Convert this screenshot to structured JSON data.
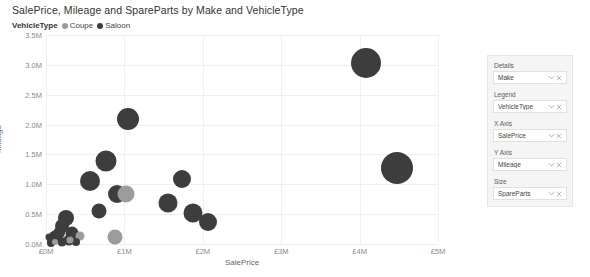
{
  "visual": {
    "title": "SalePrice, Mileage and SpareParts by Make and VehicleType"
  },
  "legend": {
    "title": "VehicleType",
    "items": [
      {
        "label": "Coupe",
        "color": "#9b9b9b"
      },
      {
        "label": "Saloon",
        "color": "#3d3d3d"
      }
    ]
  },
  "fields": {
    "wells": [
      {
        "label": "Details",
        "field": "Make"
      },
      {
        "label": "Legend",
        "field": "VehicleType"
      },
      {
        "label": "X Axis",
        "field": "SalePrice"
      },
      {
        "label": "Y Axis",
        "field": "Mileage"
      },
      {
        "label": "Size",
        "field": "SpareParts"
      }
    ],
    "icons": {
      "expand": "chevron-down-icon",
      "remove": "close-icon"
    }
  },
  "chart_data": {
    "type": "scatter",
    "title": "SalePrice, Mileage and SpareParts by Make and VehicleType",
    "xlabel": "SalePrice",
    "ylabel": "Mileage",
    "xlim": [
      0,
      5000000
    ],
    "ylim": [
      0,
      3500000
    ],
    "xticks": [
      0,
      1000000,
      2000000,
      3000000,
      4000000,
      5000000
    ],
    "xticklabels": [
      "£0M",
      "£1M",
      "£2M",
      "£3M",
      "£4M",
      "£5M"
    ],
    "yticks": [
      0,
      500000,
      1000000,
      1500000,
      2000000,
      2500000,
      3000000,
      3500000
    ],
    "yticklabels": [
      "0.0M",
      "0.5M",
      "1.0M",
      "1.5M",
      "2.0M",
      "2.5M",
      "3.0M",
      "3.5M"
    ],
    "grid": true,
    "legend_position": "top-left",
    "size_field": "SpareParts",
    "legend_field": "VehicleType",
    "detail_field": "Make",
    "series": [
      {
        "name": "Coupe",
        "color": "#9b9b9b",
        "points": [
          {
            "x": 1020000,
            "y": 830000,
            "size": 17
          },
          {
            "x": 880000,
            "y": 110000,
            "size": 15
          },
          {
            "x": 430000,
            "y": 130000,
            "size": 9
          },
          {
            "x": 300000,
            "y": 60000,
            "size": 7
          },
          {
            "x": 120000,
            "y": 40000,
            "size": 6
          }
        ]
      },
      {
        "name": "Saloon",
        "color": "#3d3d3d",
        "points": [
          {
            "x": 4080000,
            "y": 3030000,
            "size": 30
          },
          {
            "x": 4480000,
            "y": 1280000,
            "size": 32
          },
          {
            "x": 1040000,
            "y": 2100000,
            "size": 22
          },
          {
            "x": 760000,
            "y": 1390000,
            "size": 21
          },
          {
            "x": 560000,
            "y": 1060000,
            "size": 20
          },
          {
            "x": 1740000,
            "y": 1090000,
            "size": 18
          },
          {
            "x": 900000,
            "y": 830000,
            "size": 18
          },
          {
            "x": 1560000,
            "y": 690000,
            "size": 19
          },
          {
            "x": 1880000,
            "y": 520000,
            "size": 19
          },
          {
            "x": 2060000,
            "y": 370000,
            "size": 18
          },
          {
            "x": 680000,
            "y": 560000,
            "size": 15
          },
          {
            "x": 250000,
            "y": 430000,
            "size": 16
          },
          {
            "x": 200000,
            "y": 300000,
            "size": 14
          },
          {
            "x": 330000,
            "y": 190000,
            "size": 13
          },
          {
            "x": 160000,
            "y": 190000,
            "size": 12
          },
          {
            "x": 120000,
            "y": 110000,
            "size": 13
          },
          {
            "x": 290000,
            "y": 70000,
            "size": 11
          },
          {
            "x": 80000,
            "y": 60000,
            "size": 10
          },
          {
            "x": 200000,
            "y": 30000,
            "size": 9
          },
          {
            "x": 60000,
            "y": 20000,
            "size": 8
          },
          {
            "x": 380000,
            "y": 30000,
            "size": 8
          },
          {
            "x": 40000,
            "y": 120000,
            "size": 7
          }
        ]
      }
    ]
  }
}
